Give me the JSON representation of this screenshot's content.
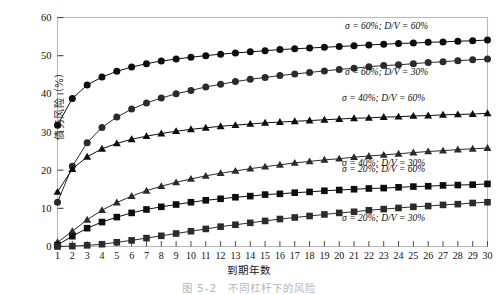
{
  "chart_data": {
    "type": "line",
    "title": "",
    "xlabel": "到期年数",
    "ylabel": "债务风险（%）",
    "xlim": [
      1,
      30
    ],
    "ylim": [
      0,
      60
    ],
    "ytick_step": 10,
    "grid": false,
    "legend_position": "inline-right",
    "yticks": [
      "0",
      "10",
      "20",
      "30",
      "40",
      "50",
      "60"
    ],
    "x": [
      1,
      2,
      3,
      4,
      5,
      6,
      7,
      8,
      9,
      10,
      11,
      12,
      13,
      14,
      15,
      16,
      17,
      18,
      19,
      20,
      21,
      22,
      23,
      24,
      25,
      26,
      27,
      28,
      29,
      30
    ],
    "xticks": [
      "1",
      "2",
      "3",
      "4",
      "5",
      "6",
      "7",
      "8",
      "9",
      "10",
      "11",
      "12",
      "13",
      "14",
      "15",
      "16",
      "17",
      "18",
      "19",
      "20",
      "21",
      "22",
      "23",
      "24",
      "25",
      "26",
      "27",
      "28",
      "29",
      "30"
    ],
    "series": [
      {
        "name": "σ = 60%;  D/V = 60%",
        "marker": "circle",
        "color": "#0d0d0d",
        "label_x": 23.2,
        "label_y": 57.0,
        "values": [
          31.8,
          38.8,
          42.3,
          44.4,
          45.9,
          47.0,
          47.9,
          48.6,
          49.1,
          49.6,
          50.0,
          50.4,
          50.7,
          51.0,
          51.3,
          51.6,
          51.8,
          52.0,
          52.2,
          52.4,
          52.6,
          52.8,
          53.0,
          53.2,
          53.3,
          53.5,
          53.6,
          53.8,
          53.9,
          54.1
        ]
      },
      {
        "name": "σ = 60%;  D/V = 30%",
        "marker": "circle",
        "color": "#2b2b2b",
        "label_x": 23.2,
        "label_y": 45.0,
        "values": [
          11.6,
          21.0,
          27.2,
          31.2,
          33.9,
          36.0,
          37.6,
          38.9,
          40.0,
          40.9,
          41.8,
          42.5,
          43.2,
          43.8,
          44.3,
          44.8,
          45.2,
          45.6,
          46.0,
          46.4,
          46.7,
          47.1,
          47.4,
          47.6,
          47.9,
          48.2,
          48.4,
          48.7,
          48.9,
          49.1
        ]
      },
      {
        "name": "σ = 40%;  D/V = 60%",
        "marker": "triangle",
        "color": "#0d0d0d",
        "label_x": 23.0,
        "label_y": 38.0,
        "values": [
          14.3,
          20.3,
          23.5,
          25.6,
          27.0,
          28.1,
          28.9,
          29.6,
          30.2,
          30.7,
          31.1,
          31.5,
          31.8,
          32.1,
          32.4,
          32.6,
          32.8,
          33.0,
          33.2,
          33.4,
          33.6,
          33.7,
          33.9,
          34.0,
          34.2,
          34.3,
          34.5,
          34.6,
          34.7,
          34.9
        ]
      },
      {
        "name": "σ = 40%;  D/V = 30%",
        "marker": "triangle",
        "color": "#2b2b2b",
        "label_x": 23.0,
        "label_y": 21.2,
        "values": [
          1.1,
          4.0,
          7.0,
          9.5,
          11.5,
          13.2,
          14.6,
          15.8,
          16.8,
          17.7,
          18.5,
          19.2,
          19.8,
          20.4,
          20.9,
          21.4,
          21.9,
          22.3,
          22.7,
          23.0,
          23.4,
          23.7,
          24.0,
          24.3,
          24.6,
          24.9,
          25.1,
          25.4,
          25.6,
          25.8
        ]
      },
      {
        "name": "σ = 20%;  D/V = 60%",
        "marker": "square",
        "color": "#0d0d0d",
        "label_x": 23.0,
        "label_y": 19.6,
        "values": [
          0.4,
          2.7,
          4.8,
          6.4,
          7.7,
          8.8,
          9.7,
          10.4,
          11.0,
          11.6,
          12.1,
          12.5,
          12.9,
          13.2,
          13.6,
          13.8,
          14.1,
          14.3,
          14.6,
          14.8,
          15.0,
          15.2,
          15.3,
          15.5,
          15.7,
          15.8,
          16.0,
          16.1,
          16.2,
          16.4
        ]
      },
      {
        "name": "σ = 20%;  D/V = 30%",
        "marker": "square",
        "color": "#2b2b2b",
        "label_x": 23.0,
        "label_y": 6.6,
        "values": [
          0.0,
          0.1,
          0.3,
          0.6,
          1.1,
          1.6,
          2.2,
          2.8,
          3.4,
          4.0,
          4.6,
          5.2,
          5.7,
          6.2,
          6.7,
          7.2,
          7.6,
          8.0,
          8.4,
          8.8,
          9.1,
          9.5,
          9.8,
          10.1,
          10.4,
          10.6,
          10.9,
          11.1,
          11.4,
          11.6
        ]
      }
    ]
  },
  "figure": {
    "ylabel": "债务风险（%）",
    "xlabel": "到期年数",
    "caption": "图 5-2　不同杠杆下的风险"
  }
}
